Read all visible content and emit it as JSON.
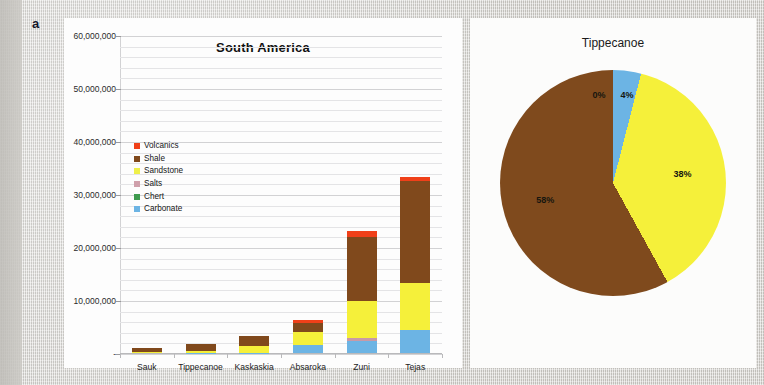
{
  "figure": {
    "panel_a_label": "a",
    "panel_b_label": "b"
  },
  "chart_data": [
    {
      "type": "bar",
      "id": "south-america-stacked-bar",
      "title": "South America",
      "xlabel": "",
      "ylabel": "",
      "stacked": true,
      "grid": true,
      "legend_position": "inside-upper-left",
      "ylim": [
        0,
        60000000
      ],
      "ytick_values": [
        0,
        10000000,
        20000000,
        30000000,
        40000000,
        50000000,
        60000000
      ],
      "ytick_labels": [
        "-",
        "10,000,000",
        "20,000,000",
        "30,000,000",
        "40,000,000",
        "50,000,000",
        "60,000,000"
      ],
      "minor_tick_step": 2000000,
      "categories": [
        "Sauk",
        "Tippecanoe",
        "Kaskaskia",
        "Absaroka",
        "Zuni",
        "Tejas"
      ],
      "series": [
        {
          "name": "Carbonate",
          "color": "#6cb4e4",
          "values": [
            0,
            60000,
            60000,
            1500000,
            2200000,
            4300000
          ]
        },
        {
          "name": "Chert",
          "color": "#3f9b4f",
          "values": [
            0,
            0,
            0,
            0,
            0,
            0
          ]
        },
        {
          "name": "Salts",
          "color": "#c89aa6",
          "values": [
            0,
            0,
            0,
            0,
            700000,
            0
          ]
        },
        {
          "name": "Sandstone",
          "color": "#f5f03a",
          "values": [
            130000,
            330000,
            1350000,
            2500000,
            7000000,
            9000000
          ]
        },
        {
          "name": "Shale",
          "color": "#80491c",
          "values": [
            880000,
            1230000,
            1800000,
            1600000,
            12000000,
            19200000
          ]
        },
        {
          "name": "Volcanics",
          "color": "#f04019",
          "values": [
            0,
            0,
            0,
            700000,
            1200000,
            800000
          ]
        }
      ]
    },
    {
      "type": "pie",
      "id": "tippecanoe-pie",
      "title": "Tippecanoe",
      "labels": [
        "Volcanics",
        "Carbonate",
        "Sandstone",
        "Shale"
      ],
      "values": [
        0,
        4,
        38,
        58
      ],
      "display_labels": [
        "0%",
        "4%",
        "38%",
        "58%"
      ],
      "colors": [
        "#f04019",
        "#6cb4e4",
        "#f5f03a",
        "#7f4a1d"
      ],
      "legend_position": "none",
      "start_angle_deg": 0
    }
  ],
  "legend": {
    "items": [
      {
        "label": "Volcanics",
        "color": "#f04019"
      },
      {
        "label": "Shale",
        "color": "#80491c"
      },
      {
        "label": "Sandstone",
        "color": "#eff04a"
      },
      {
        "label": "Salts",
        "color": "#cfa0ab"
      },
      {
        "label": "Chert",
        "color": "#3f9b4f"
      },
      {
        "label": "Carbonate",
        "color": "#6cb4e4"
      }
    ]
  }
}
